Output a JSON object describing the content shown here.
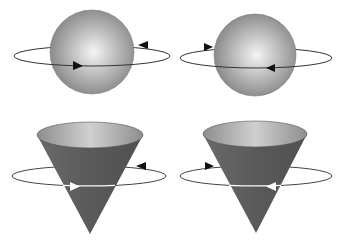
{
  "diagram": {
    "colors": {
      "background": "#ffffff",
      "sphere_highlight": "#f2f2f2",
      "sphere_mid": "#b4b4b4",
      "sphere_edge": "#6e6e6e",
      "cone_body": "#5e5e5e",
      "cone_top_light": "#c8c8c8",
      "cone_top_dark": "#8a8a8a",
      "orbit_line": "#333333",
      "arrow_dark": "#111111",
      "arrow_light": "#ffffff"
    },
    "panels": [
      {
        "id": "sphere-left",
        "shape": "sphere",
        "rotation": "counter-clockwise-from-above",
        "front_arrow": "right",
        "back_arrow": "left"
      },
      {
        "id": "sphere-right",
        "shape": "sphere",
        "rotation": "clockwise-from-above",
        "front_arrow": "left",
        "back_arrow": "right"
      },
      {
        "id": "cone-left",
        "shape": "inverted-cone",
        "rotation": "counter-clockwise-from-above",
        "front_arrow": "right",
        "back_arrow": "left"
      },
      {
        "id": "cone-right",
        "shape": "inverted-cone",
        "rotation": "clockwise-from-above",
        "front_arrow": "left",
        "back_arrow": "right"
      }
    ]
  }
}
